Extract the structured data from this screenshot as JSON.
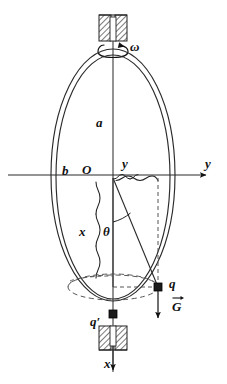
{
  "figure": {
    "labels": {
      "semi_major": "a",
      "semi_minor": "b",
      "origin": "O",
      "y_coordinate": "y",
      "y_axis": "y",
      "x_coordinate": "x",
      "angle": "θ",
      "bead": "q",
      "bead_lower": "q′",
      "gravity_vector": "G",
      "angular_velocity": "ω",
      "x_axis": "x"
    },
    "icons": {
      "top_bearing": "hatched-bearing-block-icon",
      "bottom_bearing": "hatched-bearing-block-icon",
      "rotation_arrow": "curved-rotation-arrow-icon",
      "bead_marker": "filled-square-bead-icon",
      "gravity_arrow": "down-arrow-icon",
      "y_axis_arrow": "right-arrow-icon",
      "x_axis_arrow": "down-arrow-icon",
      "brace_y": "horizontal-brace-icon",
      "brace_x": "vertical-brace-icon"
    },
    "colors": {
      "ink": "#111111",
      "line": "#2a2a2a",
      "dashed": "#555555",
      "hatch": "#333333",
      "background": "#ffffff"
    },
    "geometry": {
      "center": [
        113,
        175
      ],
      "ellipse_semi_major_px": 125,
      "ellipse_semi_minor_px": 60,
      "ring_gap_px": 4,
      "bead_point": [
        158,
        287
      ],
      "bead_lower_point": [
        113,
        316
      ],
      "dashed_circle_center": [
        113,
        287
      ],
      "dashed_circle_rx": 45,
      "dashed_circle_ry": 13
    }
  }
}
